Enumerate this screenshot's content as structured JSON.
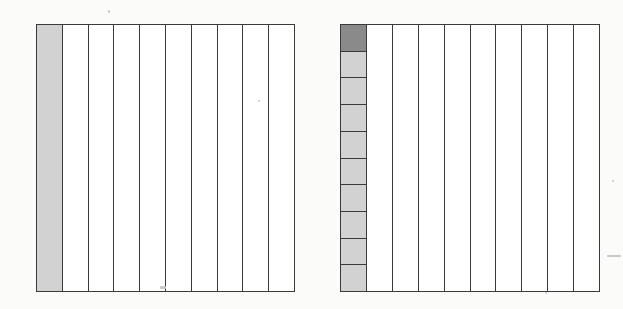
{
  "figure": {
    "models": [
      {
        "id": "left-model",
        "columns": 10,
        "shaded_columns": [
          0
        ],
        "split_column": null,
        "colors": {
          "shaded": "#d2d2d2",
          "unshaded": "#ffffff",
          "line": "#3a3a3a"
        }
      },
      {
        "id": "right-model",
        "columns": 10,
        "shaded_columns": [
          0
        ],
        "split_column": {
          "index": 0,
          "rows": 10,
          "dark_rows": [
            0
          ]
        },
        "colors": {
          "shaded": "#d2d2d2",
          "dark": "#8a8a8a",
          "unshaded": "#ffffff",
          "line": "#3a3a3a"
        }
      }
    ]
  }
}
